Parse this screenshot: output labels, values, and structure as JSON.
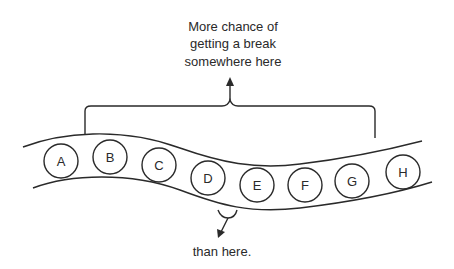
{
  "diagram": {
    "top_annotation": {
      "lines": [
        "More chance of",
        "getting a break",
        "somewhere here"
      ]
    },
    "bottom_annotation": {
      "text": "than here."
    },
    "beads": [
      {
        "label": "A"
      },
      {
        "label": "B"
      },
      {
        "label": "C"
      },
      {
        "label": "D"
      },
      {
        "label": "E"
      },
      {
        "label": "F"
      },
      {
        "label": "G"
      },
      {
        "label": "H"
      }
    ],
    "colors": {
      "ink": "#2a2a2a",
      "background": "#ffffff"
    }
  }
}
